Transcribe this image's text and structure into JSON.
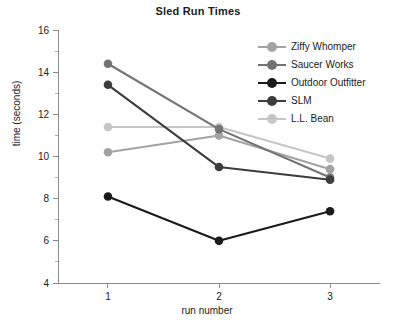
{
  "chart_data": {
    "type": "line",
    "title": "Sled Run Times",
    "xlabel": "run number",
    "ylabel": "time (seconds)",
    "x": [
      1,
      2,
      3
    ],
    "categories": [
      "1",
      "2",
      "3"
    ],
    "xtick_labels": [
      "1",
      "2",
      "3"
    ],
    "ytick_labels": [
      "4",
      "6",
      "8",
      "10",
      "12",
      "14",
      "16"
    ],
    "ytick_values": [
      4,
      6,
      8,
      10,
      12,
      14,
      16
    ],
    "yminor_values": [
      5,
      7,
      9,
      11,
      13,
      15
    ],
    "xlim": [
      0.55,
      3.45
    ],
    "ylim": [
      4,
      16
    ],
    "grid": false,
    "legend_position": "top-right",
    "series": [
      {
        "name": "Ziffy Whomper",
        "values": [
          10.2,
          11.0,
          9.4
        ],
        "color": "#a3a3a3"
      },
      {
        "name": "Saucer Works",
        "values": [
          14.4,
          11.3,
          9.0
        ],
        "color": "#737373"
      },
      {
        "name": "Outdoor Outfitter",
        "values": [
          8.1,
          6.0,
          7.4
        ],
        "color": "#1a1a1a"
      },
      {
        "name": "SLM",
        "values": [
          13.4,
          9.5,
          8.9
        ],
        "color": "#3d3d3d"
      },
      {
        "name": "L.L. Bean",
        "values": [
          11.4,
          11.4,
          9.9
        ],
        "color": "#c6c6c6"
      }
    ]
  },
  "colors": {
    "axis": "#8c8c8c",
    "text": "#1b1b1b",
    "background": "#ffffff"
  }
}
